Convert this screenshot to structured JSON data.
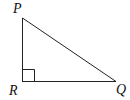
{
  "diagram": {
    "type": "right-triangle",
    "vertices": [
      {
        "label": "P",
        "x": 22,
        "y": 18
      },
      {
        "label": "R",
        "x": 22,
        "y": 81
      },
      {
        "label": "Q",
        "x": 116,
        "y": 81
      }
    ],
    "labels": {
      "P": "P",
      "R": "R",
      "Q": "Q"
    },
    "right_angle_at": "R",
    "colors": {
      "stroke": "#222222",
      "background": "#ffffff"
    }
  }
}
